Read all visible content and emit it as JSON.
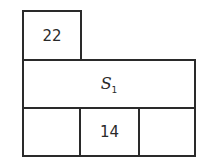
{
  "diagram": {
    "top_box": {
      "label": "22"
    },
    "middle_box": {
      "symbol": "S",
      "subscript": "1"
    },
    "bottom_row": [
      {
        "label": ""
      },
      {
        "label": "14"
      },
      {
        "label": ""
      }
    ]
  }
}
